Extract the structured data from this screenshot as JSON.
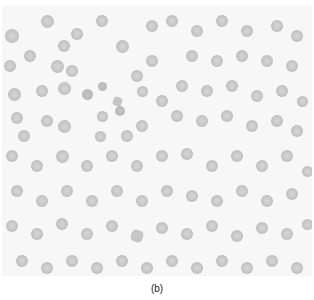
{
  "figure": {
    "caption": "(b)"
  },
  "cells": [
    [
      10,
      30,
      14,
      "n"
    ],
    [
      45,
      15,
      13,
      "n"
    ],
    [
      62,
      40,
      12,
      "n"
    ],
    [
      75,
      28,
      12,
      "n"
    ],
    [
      8,
      60,
      12,
      "n"
    ],
    [
      28,
      50,
      12,
      "n"
    ],
    [
      55,
      60,
      13,
      "n"
    ],
    [
      70,
      65,
      12,
      "n"
    ],
    [
      12,
      88,
      13,
      "n"
    ],
    [
      40,
      85,
      12,
      "n"
    ],
    [
      62,
      82,
      13,
      "n"
    ],
    [
      85,
      88,
      11,
      "s"
    ],
    [
      100,
      80,
      9,
      "s"
    ],
    [
      115,
      95,
      9,
      "sp"
    ],
    [
      100,
      110,
      11,
      "n"
    ],
    [
      118,
      105,
      10,
      "s"
    ],
    [
      15,
      112,
      12,
      "n"
    ],
    [
      45,
      115,
      12,
      "n"
    ],
    [
      62,
      120,
      13,
      "n"
    ],
    [
      22,
      130,
      12,
      "n"
    ],
    [
      98,
      130,
      11,
      "n"
    ],
    [
      125,
      130,
      12,
      "n"
    ],
    [
      140,
      120,
      12,
      "n"
    ],
    [
      120,
      40,
      13,
      "n"
    ],
    [
      135,
      70,
      12,
      "n"
    ],
    [
      150,
      55,
      12,
      "n"
    ],
    [
      140,
      85,
      11,
      "n"
    ],
    [
      160,
      95,
      12,
      "n"
    ],
    [
      100,
      15,
      12,
      "n"
    ],
    [
      150,
      20,
      12,
      "n"
    ],
    [
      170,
      15,
      12,
      "n"
    ],
    [
      195,
      25,
      12,
      "n"
    ],
    [
      220,
      15,
      12,
      "n"
    ],
    [
      245,
      25,
      12,
      "n"
    ],
    [
      275,
      20,
      12,
      "n"
    ],
    [
      295,
      30,
      12,
      "n"
    ],
    [
      190,
      50,
      12,
      "n"
    ],
    [
      215,
      55,
      12,
      "n"
    ],
    [
      240,
      50,
      12,
      "n"
    ],
    [
      265,
      55,
      12,
      "n"
    ],
    [
      290,
      60,
      12,
      "n"
    ],
    [
      180,
      80,
      12,
      "n"
    ],
    [
      205,
      85,
      12,
      "n"
    ],
    [
      230,
      80,
      12,
      "n"
    ],
    [
      255,
      90,
      12,
      "n"
    ],
    [
      280,
      85,
      12,
      "n"
    ],
    [
      300,
      95,
      11,
      "n"
    ],
    [
      175,
      110,
      12,
      "n"
    ],
    [
      200,
      115,
      12,
      "n"
    ],
    [
      225,
      110,
      12,
      "n"
    ],
    [
      250,
      120,
      12,
      "n"
    ],
    [
      275,
      115,
      12,
      "n"
    ],
    [
      295,
      125,
      12,
      "n"
    ],
    [
      10,
      150,
      12,
      "n"
    ],
    [
      35,
      160,
      12,
      "n"
    ],
    [
      60,
      150,
      13,
      "n"
    ],
    [
      85,
      160,
      12,
      "n"
    ],
    [
      110,
      150,
      12,
      "n"
    ],
    [
      135,
      160,
      12,
      "n"
    ],
    [
      160,
      150,
      12,
      "n"
    ],
    [
      185,
      148,
      12,
      "n"
    ],
    [
      210,
      160,
      12,
      "n"
    ],
    [
      235,
      150,
      12,
      "n"
    ],
    [
      260,
      160,
      12,
      "n"
    ],
    [
      285,
      150,
      12,
      "n"
    ],
    [
      305,
      165,
      11,
      "n"
    ],
    [
      15,
      185,
      12,
      "n"
    ],
    [
      40,
      195,
      12,
      "n"
    ],
    [
      65,
      185,
      12,
      "n"
    ],
    [
      90,
      195,
      12,
      "n"
    ],
    [
      115,
      185,
      12,
      "n"
    ],
    [
      140,
      195,
      12,
      "n"
    ],
    [
      165,
      185,
      12,
      "n"
    ],
    [
      190,
      190,
      12,
      "n"
    ],
    [
      215,
      195,
      12,
      "n"
    ],
    [
      240,
      185,
      12,
      "n"
    ],
    [
      265,
      195,
      12,
      "n"
    ],
    [
      290,
      188,
      12,
      "n"
    ],
    [
      10,
      220,
      12,
      "n"
    ],
    [
      35,
      228,
      12,
      "n"
    ],
    [
      60,
      218,
      12,
      "n"
    ],
    [
      85,
      228,
      12,
      "n"
    ],
    [
      110,
      220,
      12,
      "n"
    ],
    [
      135,
      230,
      12,
      "sp"
    ],
    [
      160,
      222,
      12,
      "n"
    ],
    [
      185,
      228,
      12,
      "n"
    ],
    [
      210,
      220,
      12,
      "n"
    ],
    [
      235,
      230,
      12,
      "n"
    ],
    [
      260,
      222,
      12,
      "n"
    ],
    [
      285,
      228,
      12,
      "n"
    ],
    [
      305,
      218,
      11,
      "n"
    ],
    [
      20,
      255,
      12,
      "n"
    ],
    [
      45,
      262,
      12,
      "n"
    ],
    [
      70,
      255,
      12,
      "n"
    ],
    [
      95,
      262,
      12,
      "n"
    ],
    [
      120,
      255,
      12,
      "n"
    ],
    [
      145,
      262,
      12,
      "n"
    ],
    [
      170,
      255,
      12,
      "n"
    ],
    [
      195,
      262,
      12,
      "n"
    ],
    [
      220,
      255,
      12,
      "n"
    ],
    [
      245,
      262,
      12,
      "n"
    ],
    [
      270,
      255,
      12,
      "n"
    ],
    [
      295,
      262,
      12,
      "n"
    ]
  ]
}
